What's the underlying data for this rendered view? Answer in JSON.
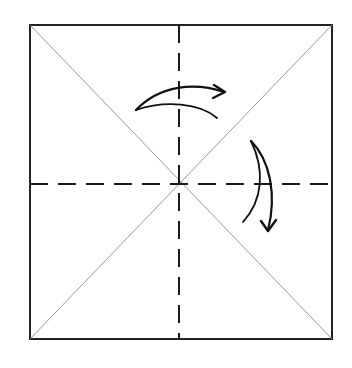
{
  "diagram": {
    "paper": {
      "x": 30,
      "y": 25,
      "width": 302,
      "height": 314
    },
    "colors": {
      "outline": "#222222",
      "diagonal": "#9a9a9a",
      "dashed": "#1a1a1a",
      "arrow": "#111111",
      "background": "#ffffff"
    },
    "center": {
      "x": 179,
      "y": 184
    },
    "lines": {
      "diagonals": [
        {
          "name": "diagonal-tl-br",
          "x1": 30,
          "y1": 25,
          "x2": 332,
          "y2": 339
        },
        {
          "name": "diagonal-tr-bl",
          "x1": 332,
          "y1": 25,
          "x2": 30,
          "y2": 339
        }
      ],
      "dashed": [
        {
          "name": "vertical-fold",
          "x1": 179,
          "y1": 25,
          "x2": 179,
          "y2": 339
        },
        {
          "name": "horizontal-fold",
          "x1": 30,
          "y1": 184,
          "x2": 332,
          "y2": 184
        }
      ],
      "dash_pattern": "18 10"
    },
    "arrows": [
      {
        "name": "top-arrow",
        "direction": "right",
        "shaft": "M136 110 C160 85, 195 82, 224 92",
        "inner": "M136 110 C165 100, 200 103, 217 118",
        "head": "M214 85 L225 92 L213 98"
      },
      {
        "name": "right-arrow",
        "direction": "down",
        "shaft": "M251 141 C270 160, 277 195, 268 230",
        "inner": "M251 141 C265 170, 263 200, 243 222",
        "head": "M261 221 L268 231 L276 220"
      }
    ]
  }
}
